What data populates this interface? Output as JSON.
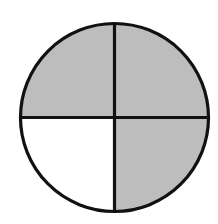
{
  "diagram": {
    "type": "fraction-circle",
    "total_parts": 4,
    "shaded_parts": 3,
    "fraction_shaded": "3/4",
    "center": [
      114.5,
      117.5
    ],
    "radius": 94,
    "stroke_color": "#111111",
    "stroke_width": 3.2,
    "shaded_color": "#bdbdbd",
    "unshaded_color": "#ffffff",
    "quadrants": [
      {
        "name": "top-left",
        "shaded": true
      },
      {
        "name": "top-right",
        "shaded": true
      },
      {
        "name": "bottom-right",
        "shaded": true
      },
      {
        "name": "bottom-left",
        "shaded": false
      }
    ]
  }
}
